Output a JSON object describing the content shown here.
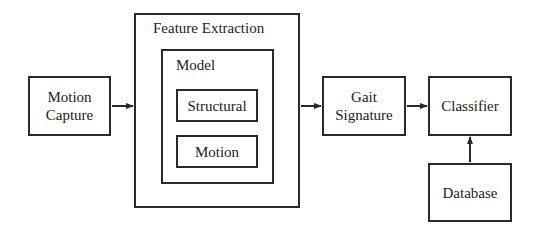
{
  "diagram": {
    "nodes": {
      "motion_capture": {
        "line1": "Motion",
        "line2": "Capture"
      },
      "feature_extraction": {
        "title": "Feature Extraction"
      },
      "model": {
        "title": "Model"
      },
      "structural": {
        "label": "Structural"
      },
      "motion": {
        "label": "Motion"
      },
      "gait_signature": {
        "line1": "Gait",
        "line2": "Signature"
      },
      "classifier": {
        "label": "Classifier"
      },
      "database": {
        "label": "Database"
      }
    },
    "edges": [
      {
        "from": "Motion Capture",
        "to": "Feature Extraction"
      },
      {
        "from": "Feature Extraction",
        "to": "Gait Signature"
      },
      {
        "from": "Gait Signature",
        "to": "Classifier"
      },
      {
        "from": "Database",
        "to": "Classifier"
      }
    ]
  }
}
